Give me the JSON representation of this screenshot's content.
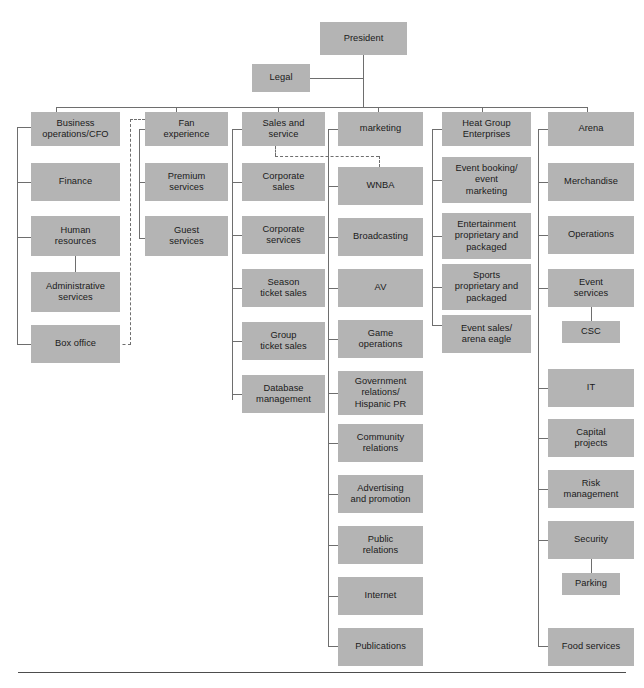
{
  "chart": {
    "type": "org-chart",
    "box_fill_color": "#b4b4b4",
    "line_color": "#6e6e6e",
    "text_color": "#1a1a1a",
    "root": "President",
    "staff": "Legal",
    "divisions": [
      "Business operations/CFO",
      "Fan experience",
      "Sales and service",
      "marketing",
      "Heat Group Enterprises",
      "Arena"
    ]
  },
  "nodes": {
    "president": "President",
    "legal": "Legal",
    "business_operations": "Business\noperations/CFO",
    "finance": "Finance",
    "human_resources": "Human\nresources",
    "administrative_services": "Administrative\nservices",
    "box_office": "Box office",
    "fan_experience": "Fan\nexperience",
    "premium_services": "Premium\nservices",
    "guest_services": "Guest\nservices",
    "sales_and_service": "Sales and\nservice",
    "corporate_sales": "Corporate\nsales",
    "corporate_services": "Corporate\nservices",
    "season_ticket_sales": "Season\nticket sales",
    "group_ticket_sales": "Group\nticket sales",
    "database_management": "Database\nmanagement",
    "marketing": "marketing",
    "wnba": "WNBA",
    "broadcasting": "Broadcasting",
    "av": "AV",
    "game_operations": "Game\noperations",
    "government_relations": "Government\nrelations/\nHispanic PR",
    "community_relations": "Community\nrelations",
    "advertising_and_promotion": "Advertising\nand promotion",
    "public_relations": "Public\nrelations",
    "internet": "Internet",
    "publications": "Publications",
    "heat_group_enterprises": "Heat Group\nEnterprises",
    "event_booking": "Event booking/\nevent\nmarketing",
    "entertainment_proprietary": "Entertainment\nproprietary and\npackaged",
    "sports_proprietary": "Sports\nproprietary and\npackaged",
    "event_sales_arena_eagle": "Event sales/\narena eagle",
    "arena": "Arena",
    "merchandise": "Merchandise",
    "operations": "Operations",
    "event_services": "Event\nservices",
    "csc": "CSC",
    "it": "IT",
    "capital_projects": "Capital\nprojects",
    "risk_management": "Risk\nmanagement",
    "security": "Security",
    "parking": "Parking",
    "food_services": "Food services"
  }
}
